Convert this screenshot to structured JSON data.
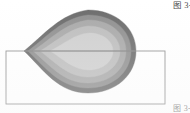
{
  "figure": {
    "background_color": "#ffffff",
    "caption_top": "图 3-",
    "caption_bottom": "图 3-",
    "rectangle": {
      "x": 6,
      "y": 51,
      "width": 159,
      "height": 53,
      "stroke": "#8d8d8d",
      "stroke_width": 0.9,
      "fill": "none"
    }
  },
  "chart_data": {
    "type": "heatmap",
    "title": "",
    "subtitle": "",
    "xlabel": "",
    "ylabel": "",
    "grid": false,
    "legend": "none",
    "xlim": [
      0,
      190
    ],
    "ylim": [
      113,
      0
    ],
    "contour_levels": [
      1,
      2,
      3,
      4,
      5
    ],
    "level_labels": [
      "outer",
      "band-2",
      "band-3",
      "band-4",
      "core"
    ],
    "level_colors": [
      "#6b6b6b",
      "#8f8f8f",
      "#a8a8a8",
      "#bdbdbd",
      "#cfcfcf"
    ],
    "shape": {
      "tip_x": 24,
      "tip_y": 51,
      "right_x": 136,
      "top_y": 10,
      "bottom_y": 93,
      "center_x": 88,
      "center_y": 51
    },
    "bands": [
      {
        "name": "outer",
        "color": "#6b6b6b",
        "path": "M 24 51 C 45 34 60 14 88 10 C 116 10 136 28 136 51 C 136 75 116 93 88 93 C 58 93 44 70 24 51 Z"
      },
      {
        "name": "band-2",
        "color": "#8f8f8f",
        "path": "M 28 51 C 47 37 62 18 88 15 C 113 15 131 30 131 51 C 131 72 113 88 88 88 C 60 88 46 68 28 51 Z"
      },
      {
        "name": "band-3",
        "color": "#a8a8a8",
        "path": "M 33 51 C 51 39 65 23 88 20 C 110 20 126 33 126 51 C 126 69 110 83 88 83 C 63 83 50 65 33 51 Z"
      },
      {
        "name": "band-4",
        "color": "#bdbdbd",
        "path": "M 40 51 C 56 42 69 28 88 26 C 106 26 120 37 120 51 C 120 65 106 77 88 77 C 68 77 55 62 40 51 Z"
      },
      {
        "name": "core",
        "color": "#cfcfcf",
        "path": "M 50 51 C 63 45 74 34 89 33 C 103 33 113 41 113 51 C 113 61 103 70 89 70 C 73 70 62 58 50 51 Z"
      }
    ],
    "midline": {
      "y": 51,
      "x0": 24,
      "x1": 136,
      "color": "#777777"
    }
  }
}
